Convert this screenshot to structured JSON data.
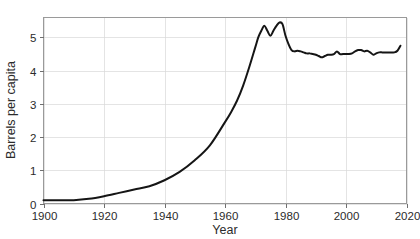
{
  "chart_data": {
    "type": "line",
    "title": "",
    "subtitle": "",
    "xlabel": "Year",
    "ylabel": "Barrels per capita",
    "xlim": [
      1900,
      2020
    ],
    "ylim": [
      0,
      5.6
    ],
    "grid": true,
    "legend": null,
    "x_ticks": [
      1900,
      1920,
      1940,
      1960,
      1980,
      2000,
      2020
    ],
    "x_tick_labels": [
      "1900",
      "1920",
      "1940",
      "1960",
      "1980",
      "2000",
      "2020"
    ],
    "y_ticks": [
      0,
      1,
      2,
      3,
      4,
      5
    ],
    "y_tick_labels": [
      "0",
      "1",
      "2",
      "3",
      "4",
      "5"
    ],
    "line_color": "#151515",
    "grid_color": "#d9d9d9",
    "frame_color": "#9a9a9a",
    "series": [
      {
        "name": "Barrels per capita",
        "x": [
          1900,
          1905,
          1910,
          1915,
          1920,
          1925,
          1930,
          1935,
          1940,
          1945,
          1950,
          1955,
          1960,
          1962,
          1964,
          1966,
          1968,
          1970,
          1971,
          1972,
          1973,
          1974,
          1975,
          1976,
          1977,
          1978,
          1979,
          1980,
          1981,
          1982,
          1983,
          1984,
          1985,
          1986,
          1987,
          1988,
          1989,
          1990,
          1991,
          1992,
          1993,
          1994,
          1995,
          1996,
          1997,
          1998,
          1999,
          2000,
          2001,
          2002,
          2003,
          2004,
          2005,
          2006,
          2007,
          2008,
          2009,
          2010,
          2011,
          2012,
          2013,
          2014,
          2015,
          2016,
          2017,
          2018
        ],
        "values": [
          0.1,
          0.1,
          0.1,
          0.14,
          0.22,
          0.32,
          0.42,
          0.52,
          0.7,
          0.95,
          1.3,
          1.75,
          2.45,
          2.75,
          3.1,
          3.55,
          4.1,
          4.7,
          5.0,
          5.2,
          5.35,
          5.2,
          5.05,
          5.2,
          5.35,
          5.45,
          5.4,
          5.05,
          4.8,
          4.62,
          4.58,
          4.6,
          4.58,
          4.55,
          4.52,
          4.52,
          4.5,
          4.48,
          4.44,
          4.4,
          4.44,
          4.48,
          4.48,
          4.5,
          4.58,
          4.5,
          4.5,
          4.5,
          4.5,
          4.52,
          4.58,
          4.62,
          4.62,
          4.58,
          4.6,
          4.55,
          4.48,
          4.52,
          4.55,
          4.55,
          4.55,
          4.55,
          4.55,
          4.55,
          4.6,
          4.75
        ]
      }
    ]
  },
  "axes": {
    "x_title": "Year",
    "y_title": "Barrels per capita"
  }
}
